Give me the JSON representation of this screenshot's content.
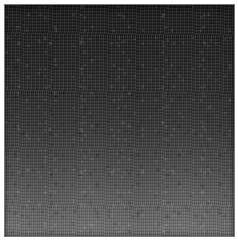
{
  "image": {
    "kind": "grayscale-texture-patch",
    "alt_text": "Grainy grayscale texture sample, dark at top fading to mid gray at bottom",
    "width_px": 238,
    "height_px": 244,
    "background_color": "#ffffff"
  },
  "patch": {
    "name": "texture-sample",
    "left_px": 4,
    "top_px": 4,
    "width_px": 231,
    "height_px": 233,
    "border_color": "#787878"
  },
  "gradient": {
    "direction": "top-to-bottom",
    "top_color": "#141414",
    "upper_mid_color": "#222222",
    "mid_color": "#2e2e2e",
    "lower_mid_color": "#4c4c4c",
    "bottom_color": "#6d6d6d",
    "stops": [
      {
        "position_pct": 0,
        "color": "#141414"
      },
      {
        "position_pct": 8,
        "color": "#191919"
      },
      {
        "position_pct": 18,
        "color": "#1d1d1d"
      },
      {
        "position_pct": 28,
        "color": "#222222"
      },
      {
        "position_pct": 38,
        "color": "#272727"
      },
      {
        "position_pct": 48,
        "color": "#2e2e2e"
      },
      {
        "position_pct": 57,
        "color": "#373737"
      },
      {
        "position_pct": 65,
        "color": "#414141"
      },
      {
        "position_pct": 73,
        "color": "#4c4c4c"
      },
      {
        "position_pct": 80,
        "color": "#565656"
      },
      {
        "position_pct": 87,
        "color": "#5f5f5f"
      },
      {
        "position_pct": 93,
        "color": "#676767"
      },
      {
        "position_pct": 100,
        "color": "#6d6d6d"
      }
    ]
  },
  "texture": {
    "grain": "fine high-frequency noise",
    "streak_orientation": "near-vertical",
    "mottling": "subtle cloudy speckle clumps",
    "vignette": "slight inset edge darkening"
  }
}
